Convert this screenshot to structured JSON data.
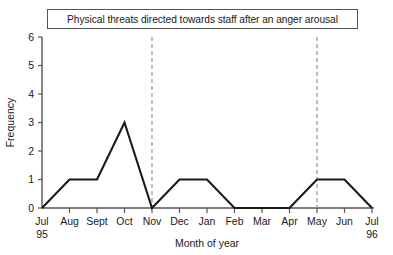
{
  "chart_data": {
    "type": "line",
    "title": "Physical threats directed towards staff after an anger arousal",
    "xlabel": "Month of year",
    "ylabel": "Frequency",
    "categories": [
      "Jul",
      "Aug",
      "Sept",
      "Oct",
      "Nov",
      "Dec",
      "Jan",
      "Feb",
      "Mar",
      "Apr",
      "May",
      "Jun",
      "Jul"
    ],
    "category_sublabels": [
      "95",
      "",
      "",
      "",
      "",
      "",
      "",
      "",
      "",
      "",
      "",
      "",
      "96"
    ],
    "values": [
      0,
      1,
      1,
      3,
      0,
      1,
      1,
      0,
      0,
      0,
      1,
      1,
      0
    ],
    "ylim": [
      0,
      6
    ],
    "yticks": [
      0,
      1,
      2,
      3,
      4,
      5,
      6
    ],
    "ytick_labels": [
      "0",
      "1",
      "2",
      "3",
      "4",
      "5",
      "6"
    ],
    "grid": false,
    "legend": false,
    "annotations": [
      {
        "name": "phase-line-nov",
        "type": "vertical-dashed-line",
        "at_category": "Nov"
      },
      {
        "name": "phase-line-may",
        "type": "vertical-dashed-line",
        "at_category": "May"
      }
    ],
    "series_color": "#1a1a1a",
    "axis_color": "#555555",
    "phase_line_color": "#8a8a8a"
  }
}
